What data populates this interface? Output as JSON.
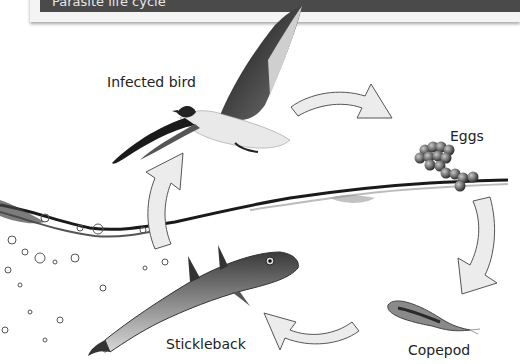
{
  "header": {
    "text": "Parasite life cycle",
    "bar_color": "#4a4a4a"
  },
  "diagram": {
    "stages": [
      {
        "id": "bird",
        "label": "Infected bird"
      },
      {
        "id": "eggs",
        "label": "Eggs"
      },
      {
        "id": "copepod",
        "label": "Copepod"
      },
      {
        "id": "stickleback",
        "label": "Stickleback"
      }
    ],
    "arrows": [
      {
        "from": "bird",
        "to": "eggs",
        "icon": "curved-arrow-right"
      },
      {
        "from": "eggs",
        "to": "copepod",
        "icon": "curved-arrow-down"
      },
      {
        "from": "copepod",
        "to": "stickleback",
        "icon": "curved-arrow-left"
      },
      {
        "from": "stickleback",
        "to": "bird",
        "icon": "curved-arrow-up"
      }
    ],
    "arrow_fill": "#ececec",
    "arrow_stroke": "#555555"
  }
}
